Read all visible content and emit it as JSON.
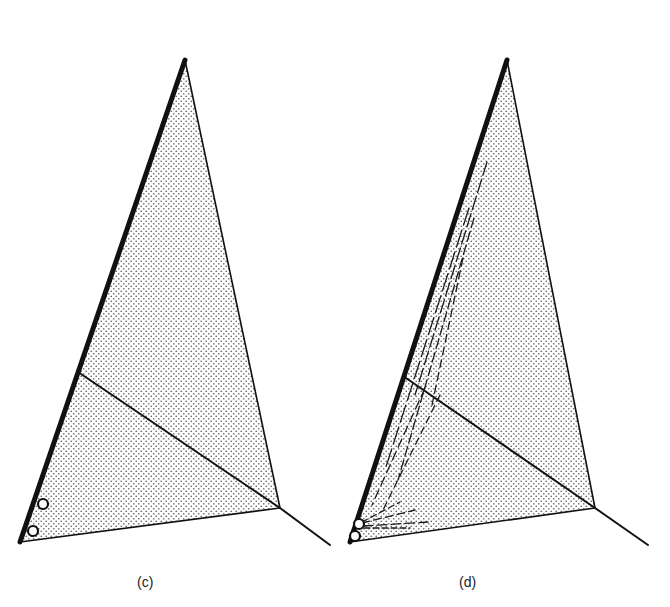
{
  "figure": {
    "colors": {
      "ink": "#111111",
      "stipple": "#6a6a6a",
      "background": "#ffffff"
    },
    "panels": [
      {
        "id": "c",
        "label": "(c)",
        "triangle": {
          "apex": [
            185,
            60
          ],
          "bottom_left": [
            20,
            542
          ],
          "right": [
            280,
            508
          ]
        },
        "thick_edge": "apex-to-bottom_left",
        "inner_line": {
          "from": [
            78,
            372
          ],
          "to": [
            280,
            508
          ]
        },
        "tail_line": {
          "from": [
            280,
            508
          ],
          "to": [
            330,
            545
          ]
        },
        "circles": [
          {
            "cx": 43,
            "cy": 504,
            "r": 5
          },
          {
            "cx": 33,
            "cy": 531,
            "r": 5
          }
        ],
        "dashed_trajectories": []
      },
      {
        "id": "d",
        "label": "(d)",
        "triangle": {
          "apex": [
            507,
            60
          ],
          "bottom_left": [
            350,
            542
          ],
          "right": [
            595,
            508
          ]
        },
        "thick_edge": "apex-to-bottom_left",
        "inner_line": {
          "from": [
            403,
            376
          ],
          "to": [
            595,
            508
          ]
        },
        "tail_line": {
          "from": [
            595,
            508
          ],
          "to": [
            648,
            545
          ]
        },
        "circles": [
          {
            "cx": 359,
            "cy": 524,
            "r": 5
          },
          {
            "cx": 355,
            "cy": 536,
            "r": 5
          }
        ],
        "dashed_trajectories": [
          {
            "from": [
              487,
              162
            ],
            "to": [
              415,
              395
            ],
            "dash": "14 4"
          },
          {
            "from": [
              469,
              208
            ],
            "to": [
              385,
              470
            ],
            "dash": "18 5"
          },
          {
            "from": [
              474,
              218
            ],
            "to": [
              398,
              480
            ],
            "dash": "10 4"
          },
          {
            "from": [
              463,
              258
            ],
            "to": [
              432,
              405
            ],
            "dash": "8 5"
          },
          {
            "from": [
              425,
              388
            ],
            "to": [
              372,
              505
            ],
            "dash": "9 5"
          },
          {
            "from": [
              440,
              395
            ],
            "to": [
              383,
              510
            ],
            "dash": "7 5"
          },
          {
            "from": [
              362,
              522
            ],
            "to": [
              400,
              502
            ],
            "dash": "6 4"
          },
          {
            "from": [
              362,
              523
            ],
            "to": [
              415,
              510
            ],
            "dash": "8 4"
          },
          {
            "from": [
              363,
              526
            ],
            "to": [
              428,
              522
            ],
            "dash": "10 4"
          },
          {
            "from": [
              364,
              528
            ],
            "to": [
              410,
              528
            ],
            "dash": "6 3"
          }
        ]
      }
    ]
  }
}
